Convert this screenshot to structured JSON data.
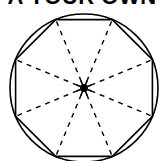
{
  "title": {
    "text": "A YOUR OWN",
    "cropped": true
  },
  "figure": {
    "circle": {
      "cx": 84,
      "cy": 88,
      "r": 74
    },
    "octagon": {
      "sides": 8,
      "rotation_deg": 22.5
    },
    "radii": {
      "count": 8,
      "style": "dashed"
    },
    "center_mark": "starburst-dot",
    "stroke_color": "#000000"
  }
}
